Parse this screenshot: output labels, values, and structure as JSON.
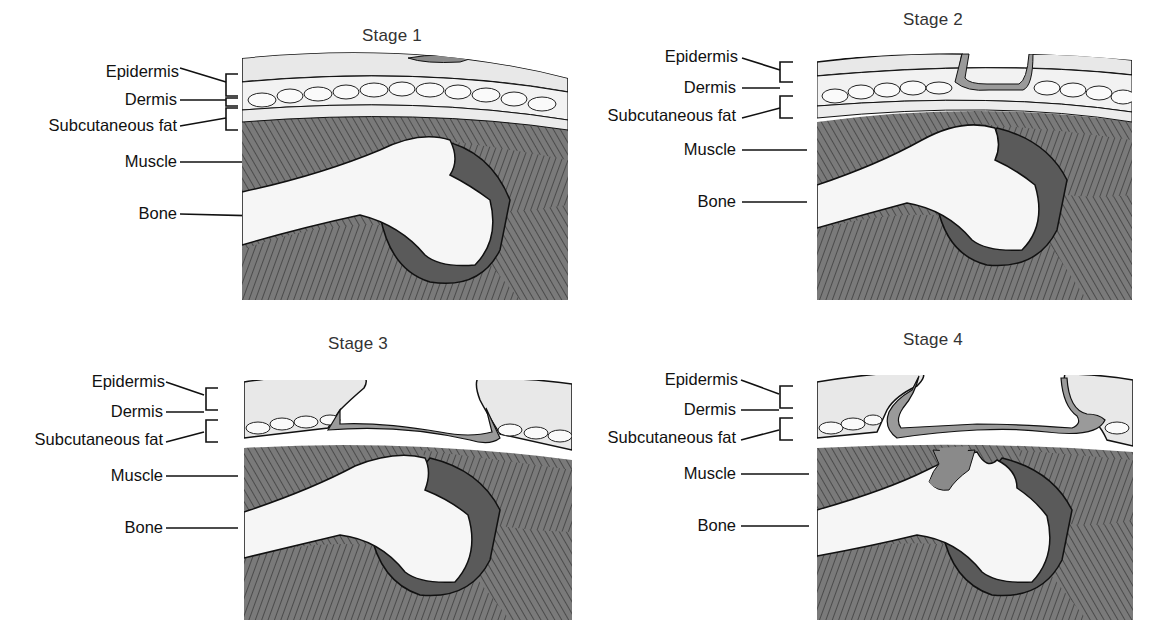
{
  "figure": {
    "panels": [
      {
        "id": "stage1",
        "title": "Stage 1",
        "labels": {
          "epidermis": "Epidermis",
          "dermis": "Dermis",
          "subcutaneous_fat": "Subcutaneous fat",
          "muscle": "Muscle",
          "bone": "Bone"
        },
        "wound": "intact-skin-discoloration"
      },
      {
        "id": "stage2",
        "title": "Stage 2",
        "labels": {
          "epidermis": "Epidermis",
          "dermis": "Dermis",
          "subcutaneous_fat": "Subcutaneous fat",
          "muscle": "Muscle",
          "bone": "Bone"
        },
        "wound": "partial-thickness-loss-into-dermis"
      },
      {
        "id": "stage3",
        "title": "Stage 3",
        "labels": {
          "epidermis": "Epidermis",
          "dermis": "Dermis",
          "subcutaneous_fat": "Subcutaneous fat",
          "muscle": "Muscle",
          "bone": "Bone"
        },
        "wound": "full-thickness-loss-to-fascia"
      },
      {
        "id": "stage4",
        "title": "Stage 4",
        "labels": {
          "epidermis": "Epidermis",
          "dermis": "Dermis",
          "subcutaneous_fat": "Subcutaneous fat",
          "muscle": "Muscle",
          "bone": "Bone"
        },
        "wound": "full-thickness-loss-to-muscle-and-bone"
      }
    ],
    "colors": {
      "background": "#ffffff",
      "outline": "#1a1a1a",
      "skin": "#e4e4e4",
      "fat": "#f2f2f2",
      "muscle": "#6e6e6e",
      "deep_tissue": "#5a5a5a",
      "bone": "#f6f6f6",
      "wound_bed": "#9a9a9a",
      "label_text": "#111111",
      "title_text": "#333333"
    }
  }
}
